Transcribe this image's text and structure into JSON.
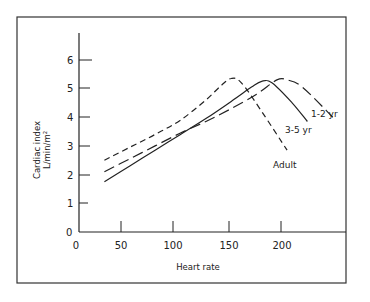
{
  "chart_data": {
    "type": "line",
    "title": "",
    "xlabel": "Heart rate",
    "ylabel": "Cardiac index",
    "ylabel_unit": "L/min/m²",
    "xlim": [
      0,
      250
    ],
    "ylim": [
      0,
      7
    ],
    "xticks": [
      0,
      50,
      100,
      150,
      200
    ],
    "yticks": [
      0,
      1,
      2,
      3,
      4,
      5,
      6
    ],
    "grid": false,
    "legend": "inline labels at curve ends",
    "series": [
      {
        "name": "Adult",
        "style": "short-dash",
        "x": [
          25,
          50,
          75,
          100,
          125,
          140,
          150,
          160,
          180,
          205
        ],
        "y": [
          2.5,
          2.95,
          3.4,
          3.9,
          4.6,
          5.1,
          5.35,
          5.2,
          4.2,
          2.85
        ]
      },
      {
        "name": "3-5 yr",
        "style": "solid",
        "x": [
          25,
          50,
          75,
          100,
          125,
          150,
          170,
          180,
          190,
          210,
          225
        ],
        "y": [
          1.75,
          2.3,
          2.85,
          3.4,
          3.95,
          4.55,
          5.05,
          5.25,
          5.2,
          4.5,
          3.85
        ]
      },
      {
        "name": "1-2 yr",
        "style": "long-dash",
        "x": [
          25,
          50,
          75,
          100,
          125,
          150,
          175,
          195,
          205,
          220,
          250
        ],
        "y": [
          2.1,
          2.55,
          3.0,
          3.45,
          3.85,
          4.3,
          4.8,
          5.3,
          5.3,
          5.05,
          4.0
        ]
      }
    ],
    "annotations": [
      "Adult",
      "3-5 yr",
      "1-2 yr"
    ]
  },
  "axis": {
    "x_ticks": [
      "0",
      "50",
      "100",
      "150",
      "200"
    ],
    "y_ticks": [
      "0",
      "1",
      "2",
      "3",
      "4",
      "5",
      "6"
    ],
    "x_title": "Heart rate",
    "y_title_line1": "Cardiac index",
    "y_title_line2": "L/min/m²"
  },
  "labels": {
    "adult": "Adult",
    "age_3_5": "3-5 yr",
    "age_1_2": "1-2 yr"
  }
}
